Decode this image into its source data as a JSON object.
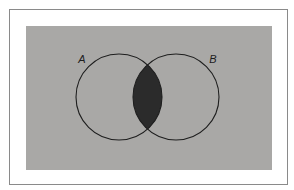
{
  "diagram": {
    "type": "venn",
    "universe": {
      "x": 26,
      "y": 26,
      "width": 246,
      "height": 144,
      "fill": "#a9a8a6"
    },
    "sets": [
      {
        "label": "A",
        "cx": 119,
        "cy": 97,
        "r": 43,
        "label_x": 82,
        "label_y": 63
      },
      {
        "label": "B",
        "cx": 176,
        "cy": 97,
        "r": 43,
        "label_x": 213,
        "label_y": 63
      }
    ],
    "shaded_region": "A ∩ B",
    "colors": {
      "background": "#ffffff",
      "frame_border": "#8a8a8a",
      "universe_fill": "#a9a8a6",
      "circle_stroke": "#1e1e1e",
      "intersection_fill": "#2b2b2b",
      "label_color": "#1e1e1e"
    }
  }
}
